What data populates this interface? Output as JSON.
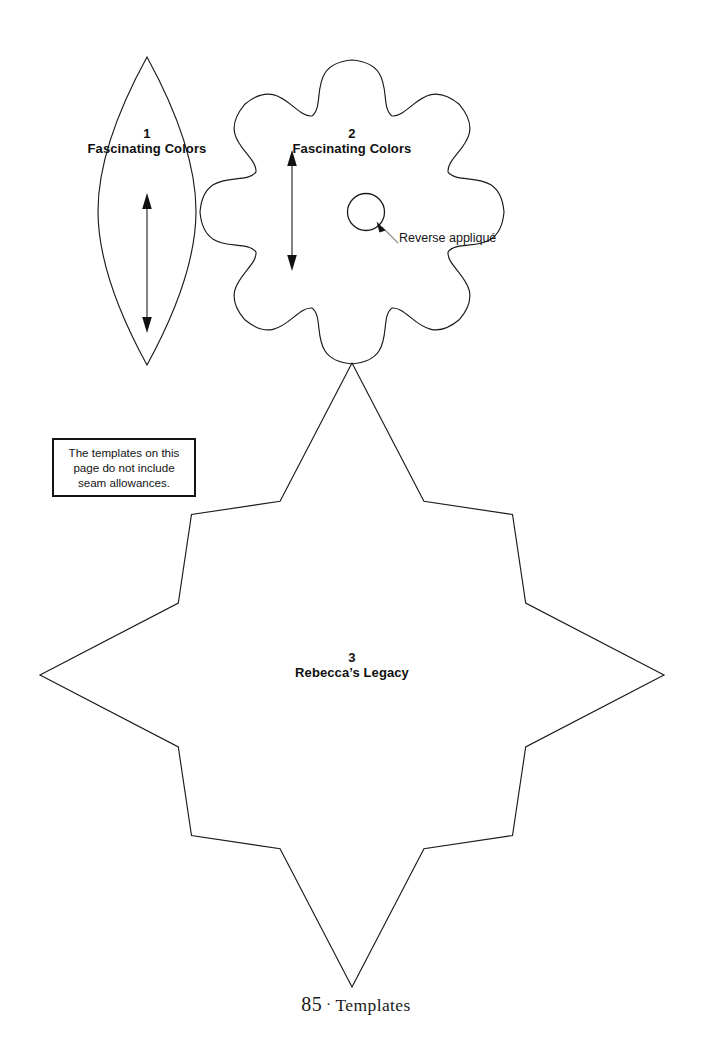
{
  "page": {
    "kind": "quilting-template-page",
    "background_color": "#ffffff",
    "ink_color": "#1b1b1b"
  },
  "note": {
    "text": "The templates on this page do not include seam allowances."
  },
  "templates": [
    {
      "number": "1",
      "name": "Fascinating Colors",
      "shape": "pointed-oval-leaf",
      "grainline_arrow": "double-headed-vertical"
    },
    {
      "number": "2",
      "name": "Fascinating Colors",
      "shape": "eight-petal-scalloped-flower",
      "grainline_arrow": "double-headed-vertical",
      "callout": "Reverse appliqué",
      "callout_target": "small-circle"
    },
    {
      "number": "3",
      "name": "Rebecca’s Legacy",
      "shape": "eight-pointed-star",
      "grainline_arrow": "none"
    }
  ],
  "footer": {
    "page_number": "85",
    "separator": "·",
    "section": "Templates"
  }
}
